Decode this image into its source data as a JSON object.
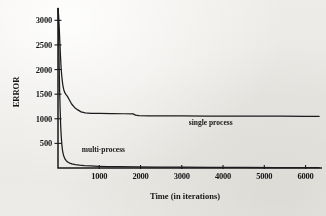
{
  "chart_data": {
    "type": "line",
    "title": "",
    "xlabel": "Time (in iterations)",
    "ylabel": "ERROR",
    "xlim": [
      0,
      6350
    ],
    "ylim": [
      0,
      3250
    ],
    "grid": false,
    "legend_position": "inline-annotations",
    "xticks": [
      1000,
      2000,
      3000,
      4000,
      5000,
      6000
    ],
    "xtick_labels": [
      "1000",
      "2000",
      "3000",
      "4000",
      "5000",
      "6000"
    ],
    "yticks": [
      500,
      1000,
      1500,
      2000,
      2500,
      3000
    ],
    "ytick_labels": [
      "500",
      "1000",
      "1500",
      "2000",
      "2500",
      "3000"
    ],
    "annotations": [
      {
        "text": "single process",
        "x": 3700,
        "y": 880
      },
      {
        "text": "multi-process",
        "x": 1100,
        "y": 330
      }
    ],
    "series": [
      {
        "name": "single process",
        "color": "#1d1d1f",
        "points": [
          [
            0,
            3240
          ],
          [
            15,
            3100
          ],
          [
            30,
            2850
          ],
          [
            45,
            2560
          ],
          [
            60,
            2280
          ],
          [
            75,
            2040
          ],
          [
            90,
            1880
          ],
          [
            105,
            1760
          ],
          [
            120,
            1670
          ],
          [
            140,
            1590
          ],
          [
            165,
            1530
          ],
          [
            195,
            1490
          ],
          [
            225,
            1460
          ],
          [
            270,
            1390
          ],
          [
            330,
            1300
          ],
          [
            400,
            1230
          ],
          [
            480,
            1180
          ],
          [
            560,
            1140
          ],
          [
            660,
            1120
          ],
          [
            800,
            1112
          ],
          [
            1000,
            1108
          ],
          [
            1300,
            1105
          ],
          [
            1600,
            1102
          ],
          [
            1820,
            1100
          ],
          [
            1880,
            1075
          ],
          [
            1960,
            1062
          ],
          [
            2200,
            1060
          ],
          [
            2600,
            1058
          ],
          [
            3000,
            1057
          ],
          [
            3600,
            1056
          ],
          [
            4200,
            1054
          ],
          [
            4800,
            1053
          ],
          [
            5400,
            1052
          ],
          [
            6000,
            1051
          ],
          [
            6330,
            1050
          ]
        ]
      },
      {
        "name": "multi-process",
        "color": "#1d1d1f",
        "points": [
          [
            0,
            3240
          ],
          [
            10,
            2950
          ],
          [
            20,
            2500
          ],
          [
            30,
            2000
          ],
          [
            40,
            1560
          ],
          [
            52,
            1180
          ],
          [
            65,
            860
          ],
          [
            80,
            620
          ],
          [
            95,
            460
          ],
          [
            110,
            355
          ],
          [
            128,
            278
          ],
          [
            148,
            222
          ],
          [
            172,
            180
          ],
          [
            200,
            148
          ],
          [
            235,
            122
          ],
          [
            280,
            100
          ],
          [
            340,
            82
          ],
          [
            420,
            68
          ],
          [
            520,
            57
          ],
          [
            640,
            48
          ],
          [
            790,
            41
          ],
          [
            980,
            35
          ],
          [
            1200,
            30
          ],
          [
            1500,
            26
          ],
          [
            1900,
            22
          ],
          [
            2400,
            19
          ],
          [
            3000,
            16
          ],
          [
            3700,
            14
          ],
          [
            4500,
            12
          ],
          [
            5300,
            10
          ],
          [
            6000,
            9
          ],
          [
            6330,
            8
          ]
        ]
      }
    ]
  }
}
